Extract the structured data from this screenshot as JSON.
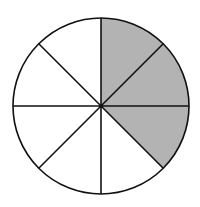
{
  "diagram": {
    "type": "fraction-circle",
    "total_sectors": 8,
    "shaded_sectors": [
      0,
      1,
      2
    ],
    "shaded_count": 3,
    "fraction_shaded": "3/8",
    "center": [
      101,
      106
    ],
    "radius": 88,
    "start_angle_deg": -90,
    "colors": {
      "shaded": "#b3b3b3",
      "unshaded": "#ffffff",
      "stroke": "#111111"
    },
    "stroke_width": 1.6
  }
}
